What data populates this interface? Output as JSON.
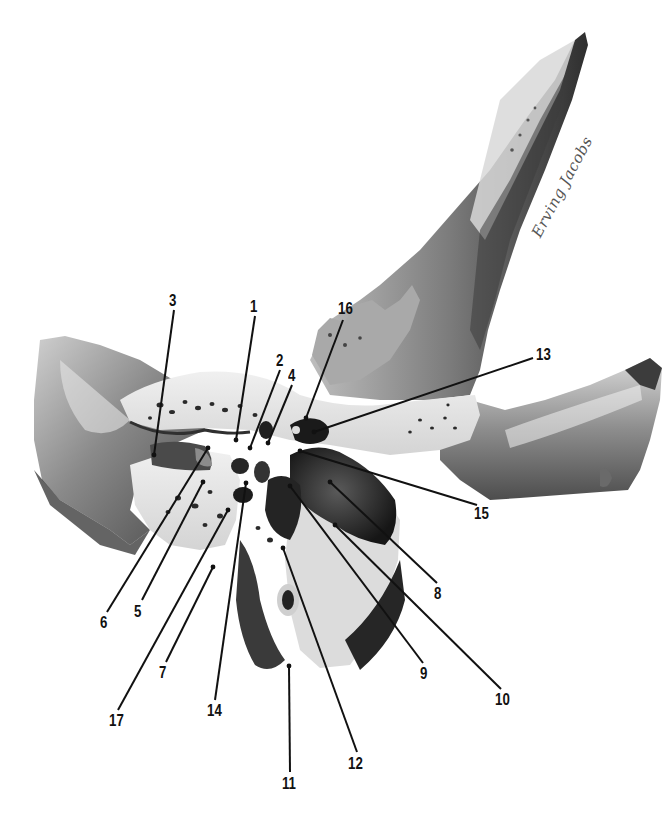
{
  "figure": {
    "type": "anatomical-illustration",
    "signature": "Erving Jacobs",
    "colors": {
      "background": "#ffffff",
      "bone_light": "#e6e6e6",
      "bone_mid": "#9a9a9a",
      "bone_dark": "#3a3a3a",
      "cavity": "#1e1e1e",
      "leader_line": "#111111",
      "label_text": "#111111"
    }
  },
  "labels": [
    {
      "id": "1",
      "text": "1",
      "x": 255,
      "y": 298,
      "target": [
        236,
        440
      ]
    },
    {
      "id": "2",
      "text": "2",
      "x": 280,
      "y": 352,
      "target": [
        250,
        448
      ]
    },
    {
      "id": "3",
      "text": "3",
      "x": 172,
      "y": 292,
      "target": [
        154,
        455
      ]
    },
    {
      "id": "4",
      "text": "4",
      "x": 292,
      "y": 367,
      "target": [
        268,
        443
      ]
    },
    {
      "id": "5",
      "text": "5",
      "x": 137,
      "y": 605,
      "target": [
        203,
        482
      ]
    },
    {
      "id": "6",
      "text": "6",
      "x": 103,
      "y": 617,
      "target": [
        208,
        448
      ]
    },
    {
      "id": "7",
      "text": "7",
      "x": 162,
      "y": 667,
      "target": [
        213,
        567
      ]
    },
    {
      "id": "8",
      "text": "8",
      "x": 437,
      "y": 588,
      "target": [
        330,
        482
      ]
    },
    {
      "id": "9",
      "text": "9",
      "x": 423,
      "y": 668,
      "target": [
        290,
        486
      ]
    },
    {
      "id": "10",
      "text": "10",
      "x": 501,
      "y": 694,
      "target": [
        335,
        525
      ]
    },
    {
      "id": "11",
      "text": "11",
      "x": 283,
      "y": 778,
      "target": [
        289,
        666
      ]
    },
    {
      "id": "12",
      "text": "12",
      "x": 350,
      "y": 758,
      "target": [
        283,
        548
      ]
    },
    {
      "id": "13",
      "text": "13",
      "x": 533,
      "y": 351,
      "target": [
        314,
        432
      ]
    },
    {
      "id": "14",
      "text": "14",
      "x": 209,
      "y": 705,
      "target": [
        246,
        483
      ]
    },
    {
      "id": "15",
      "text": "15",
      "x": 477,
      "y": 508,
      "target": [
        300,
        451
      ]
    },
    {
      "id": "16",
      "text": "16",
      "x": 333,
      "y": 302,
      "target": [
        306,
        418
      ]
    },
    {
      "id": "17",
      "text": "17",
      "x": 111,
      "y": 715,
      "target": [
        228,
        510
      ]
    }
  ]
}
